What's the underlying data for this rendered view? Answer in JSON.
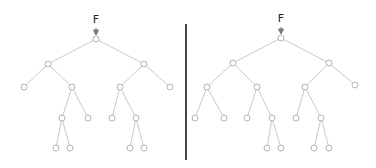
{
  "colors": {
    "edge": "#c8c8c8",
    "node_stroke": "#b4b4b4",
    "node_fill": "#ffffff",
    "arrow": "#777777",
    "divider": "#444444"
  },
  "trees": [
    {
      "label": "F",
      "label_pos": [
        96,
        19
      ],
      "nodes": {
        "r": [
          96,
          39
        ],
        "a": [
          48,
          64
        ],
        "b": [
          144,
          64
        ],
        "a1": [
          24,
          87
        ],
        "a2": [
          72,
          87
        ],
        "b1": [
          120,
          87
        ],
        "b2": [
          170,
          87
        ],
        "a21": [
          62,
          118
        ],
        "a22": [
          88,
          118
        ],
        "b11": [
          112,
          118
        ],
        "b12": [
          136,
          118
        ],
        "a211": [
          56,
          148
        ],
        "a212": [
          70,
          148
        ],
        "b121": [
          130,
          148
        ],
        "b122": [
          144,
          148
        ]
      },
      "edges": [
        [
          "r",
          "a"
        ],
        [
          "r",
          "b"
        ],
        [
          "a",
          "a1"
        ],
        [
          "a",
          "a2"
        ],
        [
          "b",
          "b1"
        ],
        [
          "b",
          "b2"
        ],
        [
          "a2",
          "a21"
        ],
        [
          "a2",
          "a22"
        ],
        [
          "b1",
          "b11"
        ],
        [
          "b1",
          "b12"
        ],
        [
          "a21",
          "a211"
        ],
        [
          "a21",
          "a212"
        ],
        [
          "b12",
          "b121"
        ],
        [
          "b12",
          "b122"
        ]
      ]
    },
    {
      "label": "F",
      "label_pos": [
        281,
        18
      ],
      "nodes": {
        "r": [
          281,
          38
        ],
        "a": [
          233,
          63
        ],
        "b": [
          329,
          63
        ],
        "a1": [
          207,
          87
        ],
        "a2": [
          257,
          87
        ],
        "b1": [
          305,
          87
        ],
        "b2": [
          355,
          85
        ],
        "a11": [
          195,
          118
        ],
        "a12": [
          224,
          118
        ],
        "a21": [
          247,
          118
        ],
        "a22": [
          272,
          118
        ],
        "b11": [
          296,
          118
        ],
        "b12": [
          321,
          118
        ],
        "a221": [
          267,
          148
        ],
        "a222": [
          281,
          148
        ],
        "b121": [
          314,
          148
        ],
        "b122": [
          329,
          148
        ]
      },
      "edges": [
        [
          "r",
          "a"
        ],
        [
          "r",
          "b"
        ],
        [
          "a",
          "a1"
        ],
        [
          "a",
          "a2"
        ],
        [
          "b",
          "b1"
        ],
        [
          "b",
          "b2"
        ],
        [
          "a1",
          "a11"
        ],
        [
          "a1",
          "a12"
        ],
        [
          "a2",
          "a21"
        ],
        [
          "a2",
          "a22"
        ],
        [
          "b1",
          "b11"
        ],
        [
          "b1",
          "b12"
        ],
        [
          "a22",
          "a221"
        ],
        [
          "a22",
          "a222"
        ],
        [
          "b12",
          "b121"
        ],
        [
          "b12",
          "b122"
        ]
      ]
    }
  ]
}
